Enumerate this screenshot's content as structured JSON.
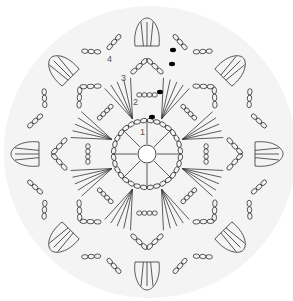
{
  "diagram": {
    "type": "crochet-chart",
    "round_labels": [
      "1",
      "2",
      "3",
      "4"
    ],
    "petals": 8,
    "background_circle_color": "#f2f2f2",
    "stroke_color": "#333333",
    "marker_color": "#000000",
    "center_ring": "magic ring"
  }
}
